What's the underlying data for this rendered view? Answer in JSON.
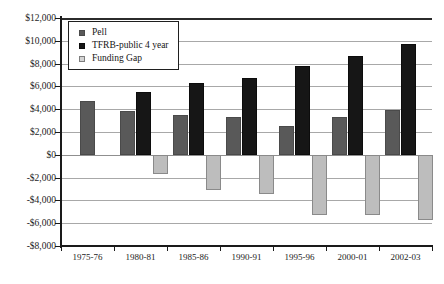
{
  "chart_data": {
    "type": "bar",
    "title": "",
    "subtitle": "",
    "xlabel": "",
    "ylabel": "",
    "categories": [
      "1975-76",
      "1980-81",
      "1985-86",
      "1990-91",
      "1995-96",
      "2000-01",
      "2002-03"
    ],
    "series": [
      {
        "name": "Pell",
        "color": "#595959",
        "values": [
          4700,
          3850,
          3450,
          3300,
          2550,
          3350,
          3950
        ]
      },
      {
        "name": "TFRB-public 4 year",
        "color": "#161616",
        "values": [
          null,
          5500,
          6300,
          6750,
          7800,
          8650,
          9700
        ]
      },
      {
        "name": "Funding Gap",
        "color": "#bdbdbd",
        "values": [
          null,
          -1700,
          -3050,
          -3450,
          -5250,
          -5300,
          -5750
        ]
      }
    ],
    "ylim": [
      -8000,
      12000
    ],
    "yticks": [
      12000,
      10000,
      8000,
      6000,
      4000,
      2000,
      0,
      -2000,
      -4000,
      -6000,
      -8000
    ],
    "ytick_labels": [
      "$12,000",
      "$10,000",
      "$8,000",
      "$6,000",
      "$4,000",
      "$2,000",
      "$0",
      "-$2,000",
      "-$4,000",
      "-$6,000",
      "-$8,000"
    ],
    "grid": true,
    "legend_position": "top-left",
    "legend_entries": [
      "Pell",
      "TFRB-public 4 year",
      "Funding Gap"
    ]
  },
  "legend": {
    "items": [
      {
        "label": "Pell",
        "swatch": "pell"
      },
      {
        "label": "TFRB-public 4 year",
        "swatch": "tfrb"
      },
      {
        "label": "Funding Gap",
        "swatch": "gap"
      }
    ]
  }
}
